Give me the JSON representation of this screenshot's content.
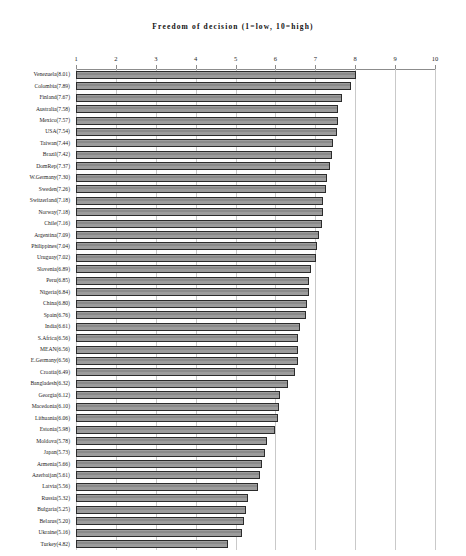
{
  "chart_data": {
    "type": "bar",
    "orientation": "horizontal",
    "title": "Freedom of decision (1=low, 10=high)",
    "xlabel": "",
    "ylabel": "",
    "xlim": [
      1,
      10
    ],
    "xticks": [
      1,
      2,
      3,
      4,
      5,
      6,
      7,
      8,
      9,
      10
    ],
    "grid": true,
    "grid_axis": "x",
    "legend": false,
    "bar_color": "#9a9a9a",
    "bar_edge_color": "#2b2b2b",
    "categories": [
      "Venezuela",
      "Colombia",
      "Finland",
      "Australia",
      "Mexico",
      "USA",
      "Taiwan",
      "Brazil",
      "DomRep",
      "W.Germany",
      "Sweden",
      "Switzerland",
      "Norway",
      "Chile",
      "Argentina",
      "Philippines",
      "Uruguay",
      "Slovenia",
      "Peru",
      "Nigeria",
      "China",
      "Spain",
      "India",
      "S.Africa",
      "MEAN",
      "E.Germany",
      "Croatia",
      "Bangladesh",
      "Georgia",
      "Macedonia",
      "Lithuania",
      "Estonia",
      "Moldova",
      "Japan",
      "Armenia",
      "Azerbaijan",
      "Latvia",
      "Russia",
      "Bulgaria",
      "Belarus",
      "Ukraine",
      "Turkey"
    ],
    "values": [
      8.01,
      7.89,
      7.67,
      7.58,
      7.57,
      7.54,
      7.44,
      7.42,
      7.37,
      7.3,
      7.26,
      7.18,
      7.18,
      7.16,
      7.09,
      7.04,
      7.02,
      6.89,
      6.85,
      6.84,
      6.8,
      6.76,
      6.61,
      6.56,
      6.56,
      6.56,
      6.49,
      6.32,
      6.12,
      6.1,
      6.06,
      5.98,
      5.78,
      5.73,
      5.66,
      5.61,
      5.56,
      5.32,
      5.25,
      5.2,
      5.16,
      4.82
    ],
    "category_labels": [
      "Venezuela(8.01)",
      "Colombia(7.89)",
      "Finland(7.67)",
      "Australia(7.58)",
      "Mexico(7.57)",
      "USA(7.54)",
      "Taiwan(7.44)",
      "Brazil(7.42)",
      "DomRep(7.37)",
      "W.Germany(7.30)",
      "Sweden(7.26)",
      "Switzerland(7.18)",
      "Norway(7.18)",
      "Chile(7.16)",
      "Argentina(7.09)",
      "Philippines(7.04)",
      "Uruguay(7.02)",
      "Slovenia(6.89)",
      "Peru(6.85)",
      "Nigeria(6.84)",
      "China(6.80)",
      "Spain(6.76)",
      "India(6.61)",
      "S.Africa(6.56)",
      "MEAN(6.56)",
      "E.Germany(6.56)",
      "Croatia(6.49)",
      "Bangladesh(6.32)",
      "Georgia(6.12)",
      "Macedonia(6.10)",
      "Lithuania(6.06)",
      "Estonia(5.98)",
      "Moldova(5.78)",
      "Japan(5.73)",
      "Armenia(5.66)",
      "Azerbaijan(5.61)",
      "Latvia(5.56)",
      "Russia(5.32)",
      "Bulgaria(5.25)",
      "Belarus(5.20)",
      "Ukraine(5.16)",
      "Turkey(4.82)"
    ]
  }
}
